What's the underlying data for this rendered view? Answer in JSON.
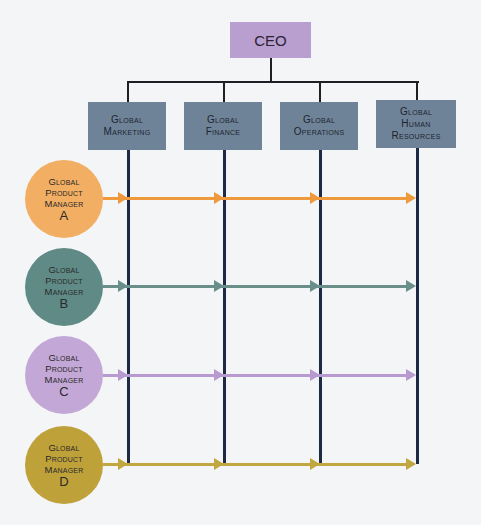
{
  "diagram": {
    "type": "matrix-organization-chart",
    "ceo": {
      "label": "CEO",
      "color": "#b89fcf"
    },
    "departments": [
      {
        "lines": [
          "Global",
          "Marketing"
        ]
      },
      {
        "lines": [
          "Global",
          "Finance"
        ]
      },
      {
        "lines": [
          "Global",
          "Operations"
        ]
      },
      {
        "lines": [
          "Global",
          "Human",
          "Resources"
        ]
      }
    ],
    "department_color": "#6f8398",
    "product_managers": [
      {
        "lines": [
          "Global",
          "Product",
          "Manager"
        ],
        "letter": "A",
        "color": "#f2ae62",
        "arrow_color": "#ee9a3c"
      },
      {
        "lines": [
          "Global",
          "Product",
          "Manager"
        ],
        "letter": "B",
        "color": "#5f8a86",
        "arrow_color": "#6a8f8a"
      },
      {
        "lines": [
          "Global",
          "Product",
          "Manager"
        ],
        "letter": "C",
        "color": "#c3a7d6",
        "arrow_color": "#b79bd0"
      },
      {
        "lines": [
          "Global",
          "Product",
          "Manager"
        ],
        "letter": "D",
        "color": "#bfa13a",
        "arrow_color": "#c2a640"
      }
    ],
    "vertical_line_color": "#1c2a45"
  }
}
